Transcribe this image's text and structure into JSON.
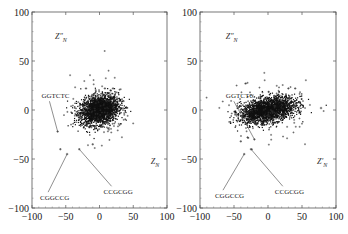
{
  "chart_data": [
    {
      "type": "scatter",
      "title": "",
      "ylabel": "Z″_N",
      "xlabel": "Z_N",
      "xlim": [
        -100,
        100
      ],
      "ylim": [
        -100,
        100
      ],
      "xticks": [
        "-100",
        "-50",
        "0",
        "50",
        "100"
      ],
      "yticks": [
        "100",
        "50",
        "0",
        "-50",
        "-100"
      ],
      "grid": false,
      "cluster": {
        "center": [
          0,
          0
        ],
        "spread_x": 14,
        "spread_y": 7,
        "density": "dense"
      },
      "annotations": [
        {
          "text": "GGTCTC",
          "label_at": [
            -86,
            12
          ],
          "points_to": [
            -62,
            -22
          ]
        },
        {
          "text": "CGGCCG",
          "label_at": [
            -88,
            -92
          ],
          "points_to": [
            -48,
            -45
          ]
        },
        {
          "text": "CCGCGG",
          "label_at": [
            6,
            -86
          ],
          "points_to": [
            -30,
            -40
          ]
        }
      ],
      "outliers": [
        [
          -62,
          -22
        ],
        [
          -48,
          -45
        ],
        [
          -30,
          -40
        ],
        [
          -58,
          -40
        ],
        [
          -20,
          22
        ],
        [
          8,
          22
        ],
        [
          20,
          22
        ],
        [
          -10,
          -35
        ]
      ]
    },
    {
      "type": "scatter",
      "title": "",
      "ylabel": "Z″_N",
      "xlabel": "Z′_N",
      "xlim": [
        -100,
        100
      ],
      "ylim": [
        -100,
        100
      ],
      "xticks": [
        "-100",
        "-50",
        "0",
        "50",
        "100"
      ],
      "yticks": [
        "100",
        "50",
        "0",
        "-50",
        "-100"
      ],
      "grid": false,
      "cluster": {
        "center": [
          0,
          0
        ],
        "spread_x": 20,
        "spread_y": 6,
        "density": "dense"
      },
      "annotations": [
        {
          "text": "GGTCTC",
          "label_at": [
            -62,
            12
          ],
          "points_to": [
            -20,
            -30
          ]
        },
        {
          "text": "CGGCCG",
          "label_at": [
            -78,
            -90
          ],
          "points_to": [
            -35,
            -45
          ]
        },
        {
          "text": "CCGCGG",
          "label_at": [
            10,
            -86
          ],
          "points_to": [
            -25,
            -40
          ]
        }
      ],
      "outliers": [
        [
          -20,
          -30
        ],
        [
          -35,
          -45
        ],
        [
          -25,
          -40
        ],
        [
          -40,
          -32
        ],
        [
          -30,
          -28
        ],
        [
          30,
          22
        ],
        [
          40,
          22
        ],
        [
          78,
          2
        ]
      ]
    }
  ]
}
